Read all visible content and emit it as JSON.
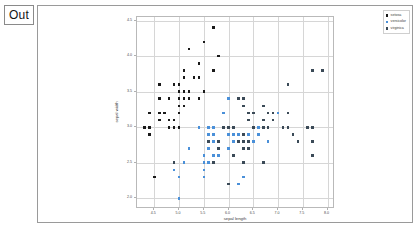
{
  "notebook": {
    "prompt_label": "Out"
  },
  "chart_data": {
    "type": "scatter",
    "title": "",
    "xlabel": "sepal length",
    "ylabel": "sepal width",
    "xlim": [
      4.15,
      8.15
    ],
    "ylim": [
      1.85,
      4.55
    ],
    "xticks": [
      4.5,
      5.0,
      5.5,
      6.0,
      6.5,
      7.0,
      7.5,
      8.0
    ],
    "xticklabels": [
      "4.5",
      "5.0",
      "5.5",
      "6.0",
      "6.5",
      "7.0",
      "7.5",
      "8.0"
    ],
    "yticks": [
      2.0,
      2.5,
      3.0,
      3.5,
      4.0,
      4.5
    ],
    "yticklabels": [
      "2.0",
      "2.5",
      "3.0",
      "3.5",
      "4.0",
      "4.5"
    ],
    "grid": true,
    "legend_position": "upper right",
    "marker": "square",
    "series": [
      {
        "name": "setosa",
        "color": "#1a1a1a",
        "points": [
          [
            5.1,
            3.5
          ],
          [
            4.9,
            3.0
          ],
          [
            4.7,
            3.2
          ],
          [
            4.6,
            3.1
          ],
          [
            5.0,
            3.6
          ],
          [
            5.4,
            3.9
          ],
          [
            4.6,
            3.4
          ],
          [
            5.0,
            3.4
          ],
          [
            4.4,
            2.9
          ],
          [
            4.9,
            3.1
          ],
          [
            5.4,
            3.7
          ],
          [
            4.8,
            3.4
          ],
          [
            4.8,
            3.0
          ],
          [
            4.3,
            3.0
          ],
          [
            5.8,
            4.0
          ],
          [
            5.7,
            4.4
          ],
          [
            5.4,
            3.9
          ],
          [
            5.1,
            3.5
          ],
          [
            5.7,
            3.8
          ],
          [
            5.1,
            3.8
          ],
          [
            5.4,
            3.4
          ],
          [
            5.1,
            3.7
          ],
          [
            4.6,
            3.6
          ],
          [
            5.1,
            3.3
          ],
          [
            4.8,
            3.4
          ],
          [
            5.0,
            3.0
          ],
          [
            5.0,
            3.4
          ],
          [
            5.2,
            3.5
          ],
          [
            5.2,
            3.4
          ],
          [
            4.7,
            3.2
          ],
          [
            4.8,
            3.1
          ],
          [
            5.4,
            3.4
          ],
          [
            5.2,
            4.1
          ],
          [
            5.5,
            4.2
          ],
          [
            4.9,
            3.1
          ],
          [
            5.0,
            3.2
          ],
          [
            5.5,
            3.5
          ],
          [
            4.9,
            3.6
          ],
          [
            4.4,
            3.0
          ],
          [
            5.1,
            3.4
          ],
          [
            5.0,
            3.5
          ],
          [
            4.5,
            2.3
          ],
          [
            4.4,
            3.2
          ],
          [
            5.0,
            3.5
          ],
          [
            5.1,
            3.8
          ],
          [
            4.8,
            3.0
          ],
          [
            5.1,
            3.8
          ],
          [
            4.6,
            3.2
          ],
          [
            5.3,
            3.7
          ],
          [
            5.0,
            3.3
          ]
        ]
      },
      {
        "name": "versicolor",
        "color": "#4a90d9",
        "points": [
          [
            7.0,
            3.2
          ],
          [
            6.4,
            3.2
          ],
          [
            6.9,
            3.1
          ],
          [
            5.5,
            2.3
          ],
          [
            6.5,
            2.8
          ],
          [
            5.7,
            2.8
          ],
          [
            6.3,
            3.3
          ],
          [
            4.9,
            2.4
          ],
          [
            6.6,
            2.9
          ],
          [
            5.2,
            2.7
          ],
          [
            5.0,
            2.0
          ],
          [
            5.9,
            3.0
          ],
          [
            6.0,
            2.2
          ],
          [
            6.1,
            2.9
          ],
          [
            5.6,
            2.9
          ],
          [
            6.7,
            3.1
          ],
          [
            5.6,
            3.0
          ],
          [
            5.8,
            2.7
          ],
          [
            6.2,
            2.2
          ],
          [
            5.6,
            2.5
          ],
          [
            5.9,
            3.2
          ],
          [
            6.1,
            2.8
          ],
          [
            6.3,
            2.5
          ],
          [
            6.1,
            2.8
          ],
          [
            6.4,
            2.9
          ],
          [
            6.6,
            3.0
          ],
          [
            6.8,
            2.8
          ],
          [
            6.7,
            3.0
          ],
          [
            6.0,
            2.9
          ],
          [
            5.7,
            2.6
          ],
          [
            5.5,
            2.4
          ],
          [
            5.5,
            2.4
          ],
          [
            5.8,
            2.7
          ],
          [
            6.0,
            2.7
          ],
          [
            5.4,
            3.0
          ],
          [
            6.0,
            3.4
          ],
          [
            6.7,
            3.1
          ],
          [
            6.3,
            2.3
          ],
          [
            5.6,
            3.0
          ],
          [
            5.5,
            2.5
          ],
          [
            5.5,
            2.6
          ],
          [
            6.1,
            3.0
          ],
          [
            5.8,
            2.6
          ],
          [
            5.0,
            2.3
          ],
          [
            5.6,
            2.7
          ],
          [
            5.7,
            3.0
          ],
          [
            5.7,
            2.9
          ],
          [
            6.2,
            2.9
          ],
          [
            5.1,
            2.5
          ],
          [
            5.7,
            2.8
          ]
        ]
      },
      {
        "name": "virginica",
        "color": "#3b4a57",
        "points": [
          [
            6.3,
            3.3
          ],
          [
            5.8,
            2.7
          ],
          [
            7.1,
            3.0
          ],
          [
            6.3,
            2.9
          ],
          [
            6.5,
            3.0
          ],
          [
            7.6,
            3.0
          ],
          [
            4.9,
            2.5
          ],
          [
            7.3,
            2.9
          ],
          [
            6.7,
            2.5
          ],
          [
            7.2,
            3.6
          ],
          [
            6.5,
            3.2
          ],
          [
            6.4,
            2.7
          ],
          [
            6.8,
            3.0
          ],
          [
            5.7,
            2.5
          ],
          [
            5.8,
            2.8
          ],
          [
            6.4,
            3.2
          ],
          [
            6.5,
            3.0
          ],
          [
            7.7,
            3.8
          ],
          [
            7.7,
            2.6
          ],
          [
            6.0,
            2.2
          ],
          [
            6.9,
            3.2
          ],
          [
            5.6,
            2.8
          ],
          [
            7.7,
            2.8
          ],
          [
            6.3,
            2.7
          ],
          [
            6.7,
            3.3
          ],
          [
            7.2,
            3.2
          ],
          [
            6.2,
            2.8
          ],
          [
            6.1,
            3.0
          ],
          [
            6.4,
            2.8
          ],
          [
            7.2,
            3.0
          ],
          [
            7.4,
            2.8
          ],
          [
            7.9,
            3.8
          ],
          [
            6.4,
            2.8
          ],
          [
            6.3,
            2.8
          ],
          [
            6.1,
            2.6
          ],
          [
            7.7,
            3.0
          ],
          [
            6.3,
            3.4
          ],
          [
            6.4,
            3.1
          ],
          [
            6.0,
            3.0
          ],
          [
            6.9,
            3.1
          ],
          [
            6.7,
            3.1
          ],
          [
            6.9,
            3.1
          ],
          [
            5.8,
            2.7
          ],
          [
            6.8,
            3.2
          ],
          [
            6.7,
            3.3
          ],
          [
            6.7,
            3.0
          ],
          [
            6.3,
            2.5
          ],
          [
            6.5,
            3.0
          ],
          [
            6.2,
            3.4
          ],
          [
            5.9,
            3.0
          ]
        ]
      }
    ]
  }
}
